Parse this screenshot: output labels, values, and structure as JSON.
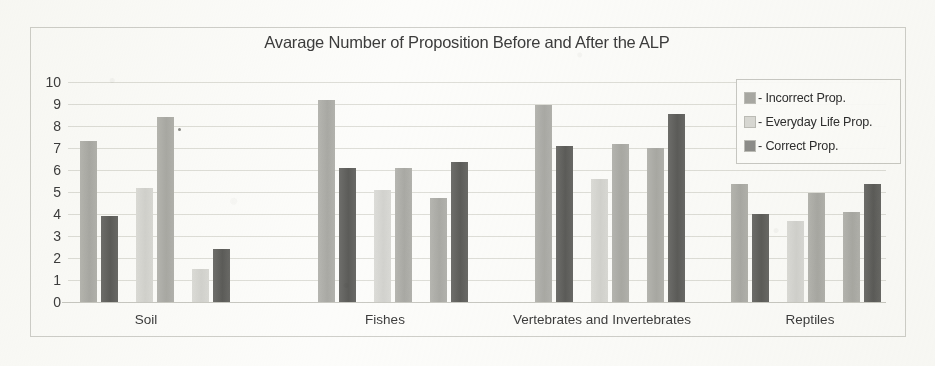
{
  "chart_data": {
    "type": "bar",
    "title": "Avarage Number of Proposition Before and After the ALP",
    "xlabel": "",
    "ylabel": "",
    "ylim": [
      0,
      10
    ],
    "ytick_labels": [
      "10",
      "9",
      "8",
      "7",
      "6",
      "5",
      "4",
      "3",
      "2",
      "1",
      "0"
    ],
    "grid": true,
    "legend_position": "top-right",
    "categories": [
      "Soil",
      "Fishes",
      "Vertebrates and Invertebrates",
      "Reptiles"
    ],
    "legend": [
      {
        "label": "- Incorrect Prop.",
        "series": "incorrect",
        "color": "#a9a9a4"
      },
      {
        "label": "- Everyday Life Prop.",
        "series": "everyday",
        "color": "#dadad6"
      },
      {
        "label": "- Correct Prop.",
        "series": "correct",
        "color": "#5c5c59"
      }
    ],
    "groups": [
      {
        "category": "Soil",
        "bars": [
          {
            "series": "incorrect",
            "value": 7.3
          },
          {
            "series": "correct",
            "value": 3.9
          },
          {
            "series": "everyday",
            "value": 5.2
          },
          {
            "series": "incorrect",
            "value": 8.4
          },
          {
            "series": "everyday",
            "value": 1.5
          },
          {
            "series": "correct",
            "value": 2.4
          }
        ]
      },
      {
        "category": "Fishes",
        "bars": [
          {
            "series": "incorrect",
            "value": 9.2
          },
          {
            "series": "correct",
            "value": 6.1
          },
          {
            "series": "everyday",
            "value": 5.1
          },
          {
            "series": "incorrect",
            "value": 6.1
          },
          {
            "series": "incorrect",
            "value": 4.75
          },
          {
            "series": "correct",
            "value": 6.35
          }
        ]
      },
      {
        "category": "Vertebrates and Invertebrates",
        "bars": [
          {
            "series": "incorrect",
            "value": 8.95
          },
          {
            "series": "correct",
            "value": 7.1
          },
          {
            "series": "everyday",
            "value": 5.6
          },
          {
            "series": "incorrect",
            "value": 7.2
          },
          {
            "series": "incorrect",
            "value": 7.0
          },
          {
            "series": "correct",
            "value": 8.55
          }
        ]
      },
      {
        "category": "Reptiles",
        "bars": [
          {
            "series": "incorrect",
            "value": 5.35
          },
          {
            "series": "correct",
            "value": 4.0
          },
          {
            "series": "everyday",
            "value": 3.7
          },
          {
            "series": "incorrect",
            "value": 4.95
          },
          {
            "series": "incorrect",
            "value": 4.1
          },
          {
            "series": "correct",
            "value": 5.35
          }
        ]
      }
    ],
    "bar_x_positions": [
      12,
      33,
      68,
      89,
      124,
      145,
      250,
      271,
      306,
      327,
      362,
      383,
      467,
      488,
      523,
      544,
      579,
      600,
      663,
      684,
      719,
      740,
      775,
      796
    ],
    "bar_width": 17,
    "category_label_x": [
      78,
      317,
      534,
      742
    ]
  }
}
